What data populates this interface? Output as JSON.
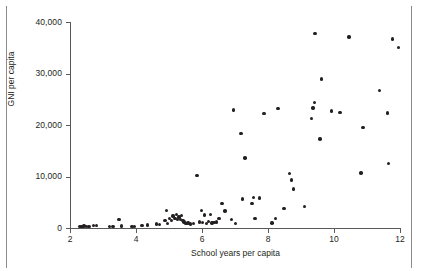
{
  "chart_data": {
    "type": "scatter",
    "title": "",
    "xlabel": "School years per capita",
    "ylabel": "GNI per capita",
    "xlim": [
      2,
      12
    ],
    "ylim": [
      0,
      40000
    ],
    "xticks": [
      2,
      4,
      6,
      8,
      10,
      12
    ],
    "xtick_labels": [
      "2",
      "4",
      "6",
      "8",
      "10",
      "12"
    ],
    "yticks": [
      0,
      10000,
      20000,
      30000,
      40000
    ],
    "ytick_labels": [
      "0",
      "10,000",
      "20,000",
      "30,000",
      "40,000"
    ],
    "grid": false,
    "legend": null,
    "marker_color": "#231f20",
    "axis_color": "#58595b",
    "points": [
      [
        2.3,
        300
      ],
      [
        2.36,
        250
      ],
      [
        2.42,
        400
      ],
      [
        2.5,
        350
      ],
      [
        2.58,
        300
      ],
      [
        2.72,
        500
      ],
      [
        2.8,
        450
      ],
      [
        3.2,
        250
      ],
      [
        3.3,
        350
      ],
      [
        3.48,
        1700
      ],
      [
        3.56,
        400
      ],
      [
        3.88,
        300
      ],
      [
        3.95,
        250
      ],
      [
        4.18,
        500
      ],
      [
        4.35,
        550
      ],
      [
        4.62,
        800
      ],
      [
        4.72,
        700
      ],
      [
        4.88,
        1400
      ],
      [
        4.92,
        3400
      ],
      [
        4.96,
        900
      ],
      [
        5.02,
        1800
      ],
      [
        5.08,
        1500
      ],
      [
        5.12,
        2300
      ],
      [
        5.18,
        1900
      ],
      [
        5.22,
        2600
      ],
      [
        5.26,
        1600
      ],
      [
        5.3,
        2100
      ],
      [
        5.34,
        1700
      ],
      [
        5.38,
        2400
      ],
      [
        5.42,
        1500
      ],
      [
        5.46,
        1200
      ],
      [
        5.52,
        900
      ],
      [
        5.58,
        1000
      ],
      [
        5.66,
        800
      ],
      [
        5.74,
        900
      ],
      [
        5.85,
        10200
      ],
      [
        5.92,
        1200
      ],
      [
        5.98,
        3400
      ],
      [
        6.02,
        1100
      ],
      [
        6.08,
        2500
      ],
      [
        6.14,
        900
      ],
      [
        6.2,
        1300
      ],
      [
        6.26,
        2600
      ],
      [
        6.3,
        1000
      ],
      [
        6.36,
        1100
      ],
      [
        6.44,
        1200
      ],
      [
        6.52,
        1900
      ],
      [
        6.6,
        4700
      ],
      [
        6.7,
        3300
      ],
      [
        6.9,
        1700
      ],
      [
        6.96,
        22900
      ],
      [
        7.02,
        900
      ],
      [
        7.18,
        18300
      ],
      [
        7.22,
        5600
      ],
      [
        7.3,
        13600
      ],
      [
        7.52,
        4800
      ],
      [
        7.56,
        5900
      ],
      [
        7.6,
        1900
      ],
      [
        7.74,
        5800
      ],
      [
        7.88,
        22200
      ],
      [
        8.12,
        1000
      ],
      [
        8.22,
        1900
      ],
      [
        8.3,
        23200
      ],
      [
        8.48,
        3800
      ],
      [
        8.66,
        10600
      ],
      [
        8.72,
        9300
      ],
      [
        8.78,
        7600
      ],
      [
        9.1,
        4200
      ],
      [
        9.32,
        21300
      ],
      [
        9.36,
        23300
      ],
      [
        9.4,
        24400
      ],
      [
        9.42,
        37800
      ],
      [
        9.58,
        17300
      ],
      [
        9.62,
        28900
      ],
      [
        9.92,
        22700
      ],
      [
        10.18,
        22400
      ],
      [
        10.45,
        37100
      ],
      [
        10.82,
        10700
      ],
      [
        10.88,
        19500
      ],
      [
        11.38,
        26700
      ],
      [
        11.62,
        22300
      ],
      [
        11.66,
        12500
      ],
      [
        11.78,
        36700
      ],
      [
        11.95,
        35100
      ]
    ]
  }
}
